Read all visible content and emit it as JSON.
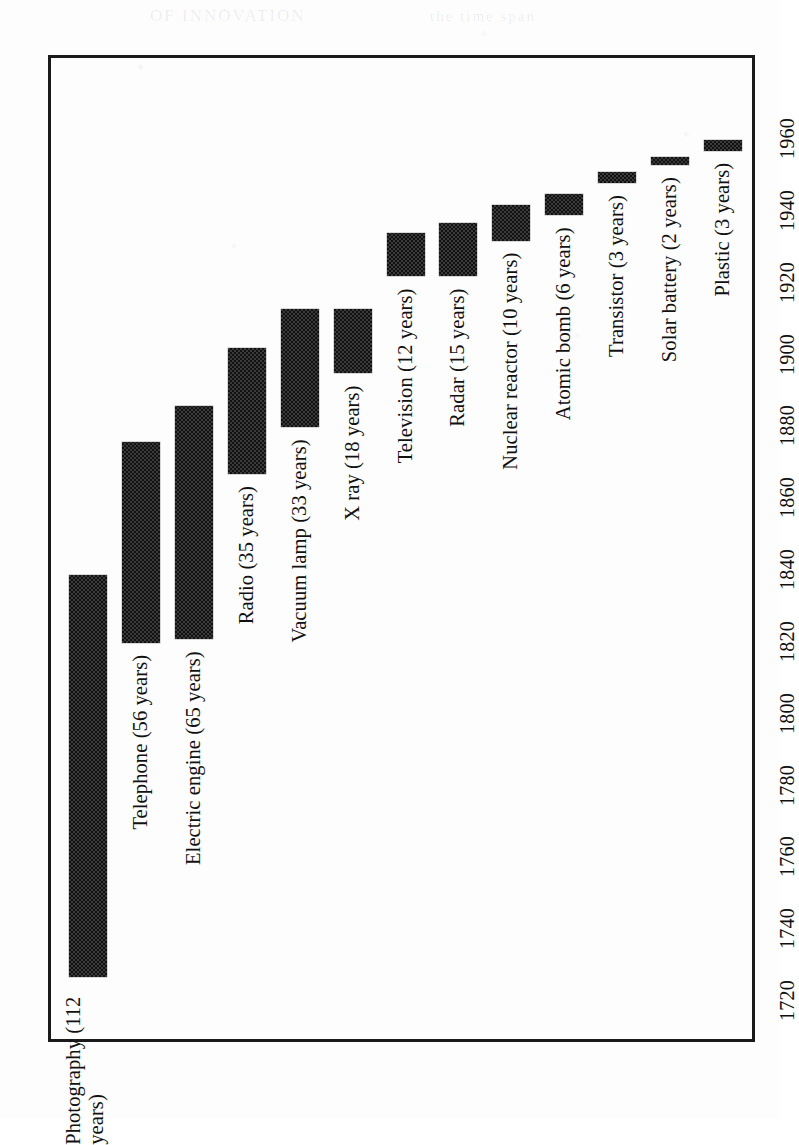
{
  "figure": {
    "orientation": "rotated-90-ccw",
    "frame_color": "#1a1a1a",
    "bar_fill": "#3a3a3a",
    "background": "#fdfdfd"
  },
  "ghost_text": [
    {
      "text": "OF INNOVATION",
      "x": 150,
      "y": 6,
      "size": 17
    },
    {
      "text": "the time span",
      "x": 430,
      "y": 8,
      "size": 15
    }
  ],
  "chart_data": {
    "type": "bar",
    "subtype": "horizontal-range-bar",
    "title": "",
    "xlabel": "",
    "ylabel": "",
    "axis_orientation": "time axis vertical on page (1720 bottom to 1960 top)",
    "grid": false,
    "legend": false,
    "xlim": [
      1715,
      1965
    ],
    "tick_labels": [
      "1720",
      "1740",
      "1760",
      "1780",
      "1800",
      "1820",
      "1840",
      "1860",
      "1880",
      "1900",
      "1920",
      "1940",
      "1960"
    ],
    "tick_values": [
      1720,
      1740,
      1760,
      1780,
      1800,
      1820,
      1840,
      1860,
      1880,
      1900,
      1920,
      1940,
      1960
    ],
    "categories": [
      "Photography",
      "Telephone",
      "Electric engine",
      "Radio",
      "Vacuum lamp",
      "X ray",
      "Television",
      "Radar",
      "Nuclear reactor",
      "Atomic bomb",
      "Transistor",
      "Solar battery",
      "Plastic"
    ],
    "bars": [
      {
        "label": "Photography (112 years)",
        "label_lines": [
          "Photography (112",
          "years)"
        ],
        "category": "Photography",
        "years": 112,
        "start": 1727,
        "end": 1839
      },
      {
        "label": "Telephone (56 years)",
        "category": "Telephone",
        "years": 56,
        "start": 1820,
        "end": 1876
      },
      {
        "label": "Electric engine (65 years)",
        "category": "Electric engine",
        "years": 65,
        "start": 1821,
        "end": 1886
      },
      {
        "label": "Radio (35 years)",
        "category": "Radio",
        "years": 35,
        "start": 1867,
        "end": 1902
      },
      {
        "label": "Vacuum lamp (33 years)",
        "category": "Vacuum lamp",
        "years": 33,
        "start": 1880,
        "end": 1913
      },
      {
        "label": "X ray (18 years)",
        "category": "X ray",
        "years": 18,
        "start": 1895,
        "end": 1913
      },
      {
        "label": "Television (12 years)",
        "category": "Television",
        "years": 12,
        "start": 1922,
        "end": 1934
      },
      {
        "label": "Radar (15 years)",
        "category": "Radar",
        "years": 15,
        "start": 1922,
        "end": 1937
      },
      {
        "label": "Nuclear reactor (10 years)",
        "category": "Nuclear reactor",
        "years": 10,
        "start": 1932,
        "end": 1942
      },
      {
        "label": "Atomic bomb (6 years)",
        "category": "Atomic bomb",
        "years": 6,
        "start": 1939,
        "end": 1945
      },
      {
        "label": "Transistor (3 years)",
        "category": "Transistor",
        "years": 3,
        "start": 1948,
        "end": 1951
      },
      {
        "label": "Solar battery (2 years)",
        "category": "Solar battery",
        "years": 2,
        "start": 1953,
        "end": 1955
      },
      {
        "label": "Plastic (3 years)",
        "category": "Plastic",
        "years": 3,
        "start": 1957,
        "end": 1960
      }
    ]
  }
}
